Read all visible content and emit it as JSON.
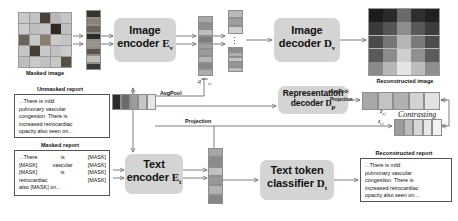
{
  "figure": {
    "type": "architecture-diagram"
  },
  "modules": {
    "image_encoder": {
      "line1": "Image",
      "line2": "encoder",
      "symbol": "E",
      "subscript": "v"
    },
    "image_decoder": {
      "line1": "Image",
      "line2": "decoder",
      "symbol": "D",
      "subscript": "v"
    },
    "representation_decoder": {
      "line1": "Representation",
      "line2": "decoder",
      "symbol": "D",
      "subscript": "p"
    },
    "text_encoder": {
      "line1": "Text",
      "line2": "encoder",
      "symbol": "E",
      "subscript": "t"
    },
    "text_token_classifier": {
      "line1": "Text token",
      "line2": "classifier",
      "symbol": "D",
      "subscript": "t"
    }
  },
  "captions": {
    "masked_image": "Masked image",
    "reconstructed_image": "Reconstructed image",
    "unmasked_report": "Unmasked report",
    "masked_report": "Masked report",
    "reconstructed_report": "Reconstructed report"
  },
  "edge_labels": {
    "avgpool_main": "AvgPool",
    "avgpool_small": "AvgPool",
    "projection_small": "Projection",
    "projection_text": "Projection",
    "contrasting": "Contrasting"
  },
  "math_labels": {
    "q_visual": {
      "base": "q",
      "sub": "v,i",
      "sup": "sum"
    },
    "z_visual": {
      "base": "z",
      "sub": "v,i"
    },
    "z_text": {
      "base": "z",
      "sub": "t,i"
    }
  },
  "reports": {
    "unmasked": [
      "...There is mild",
      "pulmonary vascular",
      "congestion.  There is",
      "increased retrocardiac",
      "opacity also seen on..."
    ],
    "reconstructed": [
      "...There is mild",
      "pulmonary vascular",
      "congestion.  There is",
      "increased retrocardiac",
      "opacity also seen on...."
    ],
    "masked": [
      [
        "...There",
        "is",
        "[MASK]"
      ],
      [
        "[MASK]",
        "vascular",
        "[MASK]"
      ],
      [
        "[MASK]",
        "is",
        "[MASK]"
      ],
      [
        "retrocardiac",
        "",
        "[MASK]"
      ],
      [
        "also [MASK] on...",
        "",
        ""
      ]
    ]
  },
  "colors": {
    "module_fill": "#d4d4d4",
    "arrow": "#6f6f6f",
    "border": "#555555",
    "text": "#111111"
  },
  "masked_image_grid": {
    "rows": 5,
    "cols": 5,
    "cells": [
      "#c9c9c9",
      "#c2c2c2",
      "#4a4238",
      "#b8b8b8",
      "#c6c6c6",
      "#cccccc",
      "#bdbdbd",
      "#c4c4c4",
      "#2e2820",
      "#bfbfbf",
      "#6b6259",
      "#c7c7c7",
      "#8a7f6e",
      "#cacaca",
      "#c3c3c3",
      "#c5c5c5",
      "#463f35",
      "#c8c8c8",
      "#c0c0c0",
      "#cbcbcb",
      "#bebebe",
      "#c9c9c9",
      "#c1c1c1",
      "#c7c7c7",
      "#55503f"
    ]
  },
  "reconstructed_image_grid": {
    "rows": 5,
    "cols": 5,
    "cells": [
      "#1c1c1c",
      "#2a2a2a",
      "#6a6a6a",
      "#2f2f2f",
      "#202020",
      "#3a3a3a",
      "#555555",
      "#8d8d8d",
      "#585858",
      "#3c3c3c",
      "#4a4a4a",
      "#767676",
      "#b5b5b5",
      "#7a7a7a",
      "#4c4c4c",
      "#5a5a5a",
      "#8c8c8c",
      "#cfcfcf",
      "#909090",
      "#5c5c5c",
      "#8a8a8a",
      "#b6b6b6",
      "#e4e4e4",
      "#bcbcbc",
      "#8e8e8e"
    ]
  },
  "token_strips": {
    "image_patch_sequence": [
      "#3a332c",
      "#8a8276",
      "#6d6459",
      "#2f2a24",
      "#9b948a",
      "#5b534a",
      "#c2bdb4",
      "#3d3932"
    ],
    "encoder_output_top": [
      "#a9a9a9",
      "#8f8f8f",
      "#bdbdbd",
      "#7d7d7d",
      "#a0a0a0"
    ],
    "encoder_output_bottom": [
      "#9a9a9a",
      "#b4b4b4",
      "#868686",
      "#ababab"
    ],
    "decoder_input": [
      "#b9b9b9",
      "#9e9e9e",
      "#cfcfcf",
      "#8c8c8c",
      "#aeaeae",
      "#c4c4c4",
      "#979797",
      "#bbbbbb"
    ],
    "text_embedding": [
      "#2b2b2b",
      "#6a6a6a",
      "#9c9c9c",
      "#c6c6c6",
      "#e6e6e6"
    ],
    "text_encoder_output": [
      "#a5a5a5",
      "#8b8b8b",
      "#c0c0c0",
      "#999999",
      "#b2b2b2",
      "#868686"
    ],
    "z_visual_row": [
      "#a8a8a8",
      "#c3c3c3",
      "#b0b0b0",
      "#d2d2d2",
      "#e2e2e2"
    ],
    "z_text_row": [
      "#9d9d9d",
      "#bcbcbc",
      "#d6d6d6",
      "#e8e8e8",
      "#f2f2f2"
    ]
  }
}
